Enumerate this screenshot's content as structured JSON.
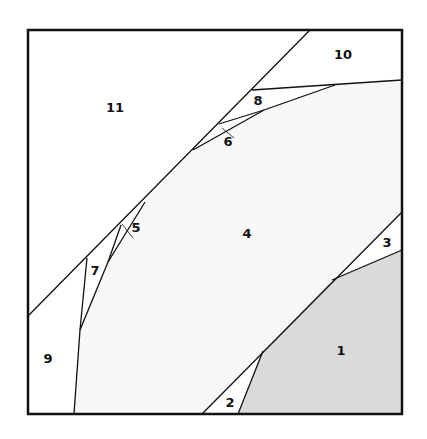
{
  "diagram": {
    "type": "region-partition",
    "colors": {
      "frame": "#111111",
      "background": "#ffffff",
      "light_region": "#f7f7f7",
      "shaded_region": "#dadada",
      "line": "#111111"
    },
    "regions": [
      {
        "id": "1",
        "label": "1",
        "x": 341,
        "y": 351
      },
      {
        "id": "2",
        "label": "2",
        "x": 230,
        "y": 406
      },
      {
        "id": "3",
        "label": "3",
        "x": 387,
        "y": 246
      },
      {
        "id": "4",
        "label": "4",
        "x": 247,
        "y": 236
      },
      {
        "id": "5",
        "label": "5",
        "x": 136,
        "y": 232
      },
      {
        "id": "6",
        "label": "6",
        "x": 227,
        "y": 145
      },
      {
        "id": "7",
        "label": "7",
        "x": 95,
        "y": 274
      },
      {
        "id": "8",
        "label": "8",
        "x": 258,
        "y": 104
      },
      {
        "id": "9",
        "label": "9",
        "x": 48,
        "y": 362
      },
      {
        "id": "10",
        "label": "10",
        "x": 343,
        "y": 58
      },
      {
        "id": "11",
        "label": "11",
        "x": 115,
        "y": 110
      }
    ]
  }
}
